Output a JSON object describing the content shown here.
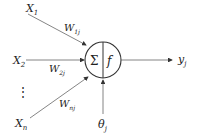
{
  "diagram": {
    "title": "",
    "inputs": [
      {
        "label": "X",
        "sub": "1",
        "weight": "W",
        "weight_sub": "1j"
      },
      {
        "label": "X",
        "sub": "2",
        "weight": "W",
        "weight_sub": "2j"
      },
      {
        "label": "X",
        "sub": "n",
        "weight": "W",
        "weight_sub": "nj"
      }
    ],
    "ellipsis": "⋮",
    "neuron": {
      "sum_symbol": "Σ",
      "activation": "f"
    },
    "threshold": {
      "label": "θ",
      "sub": "j"
    },
    "output": {
      "label": "y",
      "sub": "j"
    },
    "colors": {
      "line": "#555555",
      "text": "#222222"
    }
  }
}
